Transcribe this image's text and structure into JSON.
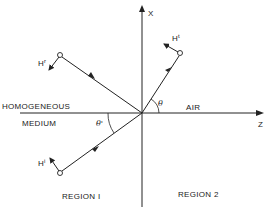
{
  "axes": {
    "vertical_label": "X",
    "horizontal_label": "Z"
  },
  "media": {
    "left_top": "HOMOGENEOUS",
    "left_bottom": "MEDIUM",
    "right": "AIR"
  },
  "regions": {
    "left": "REGION I",
    "right": "REGION 2"
  },
  "angles": {
    "transmitted": "θ",
    "incident": "θ'"
  },
  "vectors": {
    "reflected": {
      "base": "H",
      "sup": "r"
    },
    "transmitted": {
      "base": "H",
      "sup": "t"
    },
    "incident": {
      "base": "H",
      "sup": "i"
    }
  },
  "colors": {
    "stroke": "#222222",
    "background": "#ffffff"
  }
}
